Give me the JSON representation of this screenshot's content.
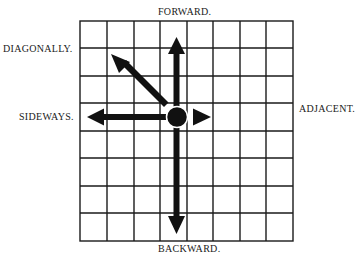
{
  "labels": {
    "forward": "FORWARD.",
    "backward": "BACKWARD.",
    "sideways": "SIDEWAYS.",
    "adjacent": "ADJACENT.",
    "diagonally": "DIAGONALLY."
  },
  "grid": {
    "columns": 8,
    "rows": 8,
    "line_color": "#1a1a1a",
    "background": "#ffffff"
  },
  "piece": {
    "shape": "circle",
    "color": "#111111",
    "grid_position": {
      "column": 4,
      "row": 4
    }
  },
  "arrows": [
    {
      "direction": "forward",
      "label_ref": "forward",
      "length_cells": 3
    },
    {
      "direction": "backward",
      "label_ref": "backward",
      "length_cells": 4
    },
    {
      "direction": "sideways",
      "label_ref": "sideways",
      "length_cells": 3
    },
    {
      "direction": "adjacent",
      "label_ref": "adjacent",
      "length_cells": 1
    },
    {
      "direction": "diagonally",
      "label_ref": "diagonally",
      "length_cells": 2
    }
  ]
}
